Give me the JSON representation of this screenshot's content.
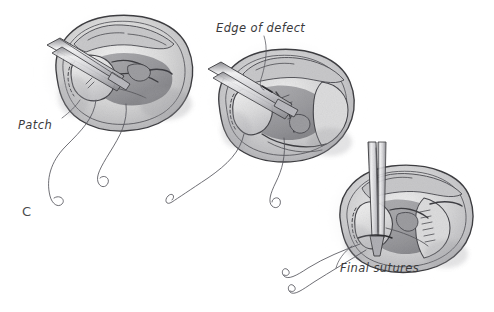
{
  "figure": {
    "panel_letter": "C",
    "medium": "graphite pencil illustration",
    "background_color": "#ffffff",
    "ink_color": "#3e3e42",
    "label_color": "#3a3a3c",
    "panels": [
      {
        "id": "panel-left",
        "order": 1,
        "stage_label": "Patch",
        "description": "Forceps holding patch over defect, first sutures placed",
        "instrument": "forceps",
        "suture_tails": 2
      },
      {
        "id": "panel-middle",
        "order": 2,
        "stage_label": "Edge of defect",
        "description": "Patch being sewn to the edge of the defect with running suture",
        "instrument": "forceps",
        "suture_tails": 2
      },
      {
        "id": "panel-right",
        "order": 3,
        "stage_label": "Final sutures",
        "description": "Needle holder placing the final sutures to complete closure",
        "instrument": "needle-holder",
        "suture_tails": 2
      }
    ],
    "labels": {
      "patch": "Patch",
      "edge_of_defect": "Edge of defect",
      "final_sutures": "Final sutures"
    }
  }
}
